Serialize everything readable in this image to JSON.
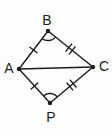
{
  "figure": {
    "background": "#fdfdfd",
    "stroke_color": "#1c1c1c",
    "line_width": 1.4,
    "dot_radius": 2.2,
    "label_font_size": 14,
    "tick_half_length": 4.5,
    "double_tick_gap": 2.2,
    "width": 112,
    "height": 133,
    "vertices": [
      {
        "id": "A",
        "label": "A",
        "x": 19,
        "y": 69,
        "label_x": 9,
        "label_y": 73
      },
      {
        "id": "B",
        "label": "B",
        "x": 48,
        "y": 31,
        "label_x": 47,
        "label_y": 25
      },
      {
        "id": "C",
        "label": "C",
        "x": 93,
        "y": 67,
        "label_x": 104,
        "label_y": 71
      },
      {
        "id": "P",
        "label": "P",
        "x": 50,
        "y": 103,
        "label_x": 51,
        "label_y": 122
      }
    ],
    "edges": [
      {
        "from": "A",
        "to": "B",
        "ticks": 1
      },
      {
        "from": "B",
        "to": "C",
        "ticks": 2
      },
      {
        "from": "A",
        "to": "P",
        "ticks": 1
      },
      {
        "from": "P",
        "to": "C",
        "ticks": 2
      },
      {
        "from": "A",
        "to": "C",
        "ticks": 0
      }
    ],
    "angle_marks": [
      {
        "vertex": "B",
        "between": [
          "A",
          "C"
        ],
        "radius": 9.5
      },
      {
        "vertex": "P",
        "between": [
          "A",
          "C"
        ],
        "radius": 9.5
      }
    ]
  }
}
